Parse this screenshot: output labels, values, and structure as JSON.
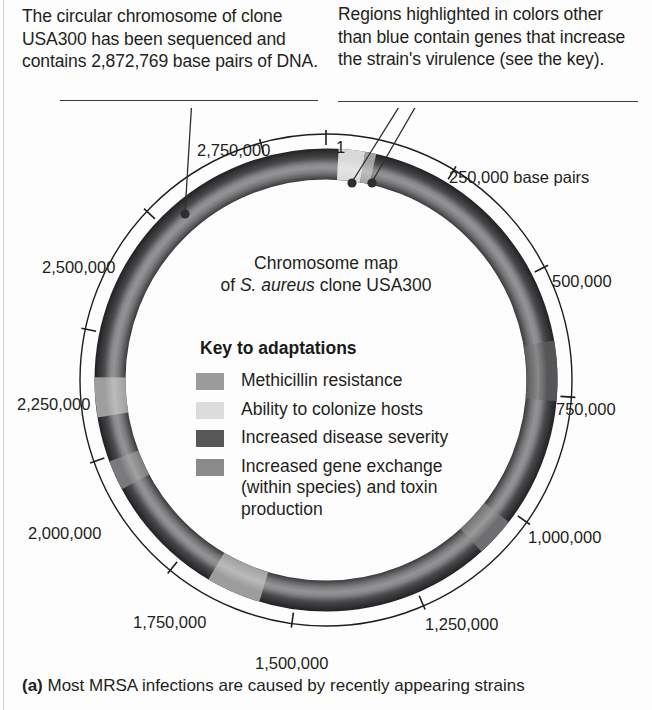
{
  "callouts": {
    "left": "The circular chromosome of clone USA300 has been sequenced and contains 2,872,769 base pairs of DNA.",
    "right": "Regions highlighted in colors other than blue contain genes that increase the strain's virulence (see the key)."
  },
  "map": {
    "title_line1": "Chromosome map",
    "title_line2_pre": "of ",
    "title_line2_italic": "S. aureus",
    "title_line2_post": " clone USA300",
    "key_heading": "Key to adaptations",
    "key_items": [
      {
        "label": "Methicillin resistance",
        "color": "#9b9b9b"
      },
      {
        "label": "Ability to colonize hosts",
        "color": "#dcdcdc"
      },
      {
        "label": "Increased disease severity",
        "color": "#575757"
      },
      {
        "label": "Increased gene exchange (within species) and toxin production",
        "color": "#8a8a8a"
      }
    ],
    "tick_labels": [
      {
        "text": "1",
        "x": 336,
        "y": 138
      },
      {
        "text": "250,000 base pairs",
        "x": 449,
        "y": 168
      },
      {
        "text": "500,000",
        "x": 552,
        "y": 272
      },
      {
        "text": "750,000",
        "x": 556,
        "y": 400
      },
      {
        "text": "1,000,000",
        "x": 528,
        "y": 528
      },
      {
        "text": "1,250,000",
        "x": 425,
        "y": 615
      },
      {
        "text": "1,500,000",
        "x": 255,
        "y": 654
      },
      {
        "text": "1,750,000",
        "x": 133,
        "y": 613
      },
      {
        "text": "2,000,000",
        "x": 28,
        "y": 524
      },
      {
        "text": "2,250,000",
        "x": 17,
        "y": 395
      },
      {
        "text": "2,500,000",
        "x": 42,
        "y": 258
      },
      {
        "text": "2,750,000",
        "x": 197,
        "y": 141
      }
    ],
    "ring_base_color": "#3d3d3f",
    "highlight_segments": [
      {
        "name": "colonize-top",
        "color": "#d9d9d9",
        "start_bp": 25000,
        "end_bp": 78000
      },
      {
        "name": "methicillin-top",
        "color": "#a3a3a3",
        "start_bp": 78000,
        "end_bp": 100000
      },
      {
        "name": "severity-right",
        "color": "#565658",
        "start_bp": 640000,
        "end_bp": 760000
      },
      {
        "name": "exchange-lower-right",
        "color": "#6e6e70",
        "start_bp": 1020000,
        "end_bp": 1100000
      },
      {
        "name": "colonize-bottom",
        "color": "#9d9d9d",
        "start_bp": 1570000,
        "end_bp": 1680000
      },
      {
        "name": "exchange-left",
        "color": "#7a7a7c",
        "start_bp": 1930000,
        "end_bp": 1990000
      },
      {
        "name": "colonize-left",
        "color": "#9e9e9e",
        "start_bp": 2080000,
        "end_bp": 2160000
      }
    ],
    "genome_size_bp": 2872769
  },
  "caption": {
    "marker": "(a)",
    "text": " Most MRSA infections are caused by recently appearing strains"
  }
}
